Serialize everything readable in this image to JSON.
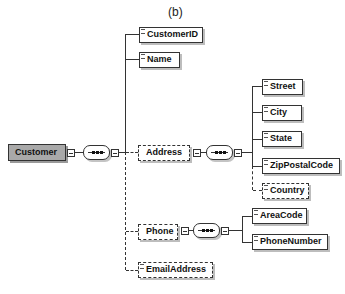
{
  "title": "(b)",
  "root": {
    "label": "Customer"
  },
  "customer_children": [
    {
      "label": "CustomerID",
      "optional": false
    },
    {
      "label": "Name",
      "optional": false
    },
    {
      "label": "Address",
      "optional": true
    },
    {
      "label": "Phone",
      "optional": true
    },
    {
      "label": "EmailAddress",
      "optional": true
    }
  ],
  "address_children": [
    {
      "label": "Street",
      "optional": false
    },
    {
      "label": "City",
      "optional": false
    },
    {
      "label": "State",
      "optional": false
    },
    {
      "label": "ZipPostalCode",
      "optional": false
    },
    {
      "label": "Country",
      "optional": true
    }
  ],
  "phone_children": [
    {
      "label": "AreaCode",
      "optional": false
    },
    {
      "label": "PhoneNumber",
      "optional": false
    }
  ],
  "compositor": {
    "type": "sequence",
    "icon": "sequence-icon"
  }
}
